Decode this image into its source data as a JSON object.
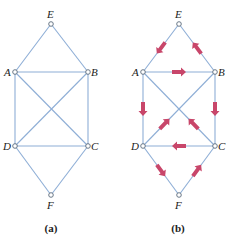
{
  "figures": [
    {
      "id": "a",
      "caption": "(a)",
      "caption_pos": [
        51,
        232
      ],
      "nodes": [
        {
          "name": "E",
          "x": 51,
          "y": 24,
          "lx": 47,
          "ly": 18
        },
        {
          "name": "A",
          "x": 15,
          "y": 72,
          "lx": 4,
          "ly": 76
        },
        {
          "name": "B",
          "x": 88,
          "y": 72,
          "lx": 91,
          "ly": 76
        },
        {
          "name": "D",
          "x": 15,
          "y": 146,
          "lx": 3,
          "ly": 150
        },
        {
          "name": "C",
          "x": 88,
          "y": 146,
          "lx": 91,
          "ly": 150
        },
        {
          "name": "F",
          "x": 51,
          "y": 195,
          "lx": 47,
          "ly": 209
        }
      ],
      "edges": [
        [
          "E",
          "A"
        ],
        [
          "E",
          "B"
        ],
        [
          "A",
          "B"
        ],
        [
          "A",
          "D"
        ],
        [
          "B",
          "C"
        ],
        [
          "A",
          "C"
        ],
        [
          "B",
          "D"
        ],
        [
          "D",
          "C"
        ],
        [
          "D",
          "F"
        ],
        [
          "C",
          "F"
        ]
      ],
      "arrows": []
    },
    {
      "id": "b",
      "caption": "(b)",
      "caption_pos": [
        178,
        232
      ],
      "nodes": [
        {
          "name": "E",
          "x": 179,
          "y": 24,
          "lx": 175,
          "ly": 18
        },
        {
          "name": "A",
          "x": 143,
          "y": 72,
          "lx": 132,
          "ly": 76
        },
        {
          "name": "B",
          "x": 215,
          "y": 72,
          "lx": 218,
          "ly": 76
        },
        {
          "name": "D",
          "x": 143,
          "y": 146,
          "lx": 131,
          "ly": 150
        },
        {
          "name": "C",
          "x": 215,
          "y": 146,
          "lx": 218,
          "ly": 150
        },
        {
          "name": "F",
          "x": 179,
          "y": 195,
          "lx": 175,
          "ly": 209
        }
      ],
      "edges": [
        [
          "E",
          "A"
        ],
        [
          "E",
          "B"
        ],
        [
          "A",
          "B"
        ],
        [
          "A",
          "D"
        ],
        [
          "B",
          "C"
        ],
        [
          "A",
          "C"
        ],
        [
          "B",
          "D"
        ],
        [
          "D",
          "C"
        ],
        [
          "D",
          "F"
        ],
        [
          "C",
          "F"
        ]
      ],
      "arrows": [
        {
          "from": "E",
          "to": "A"
        },
        {
          "from": "B",
          "to": "E"
        },
        {
          "from": "A",
          "to": "B"
        },
        {
          "from": "A",
          "to": "D"
        },
        {
          "from": "B",
          "to": "C"
        },
        {
          "from": "D",
          "to": "B"
        },
        {
          "from": "C",
          "to": "A"
        },
        {
          "from": "C",
          "to": "D"
        },
        {
          "from": "D",
          "to": "F"
        },
        {
          "from": "F",
          "to": "C"
        }
      ]
    }
  ],
  "colors": {
    "edge": "#8eaed6",
    "arrow": "#c8466a",
    "node_stroke": "#5a6a7a"
  }
}
